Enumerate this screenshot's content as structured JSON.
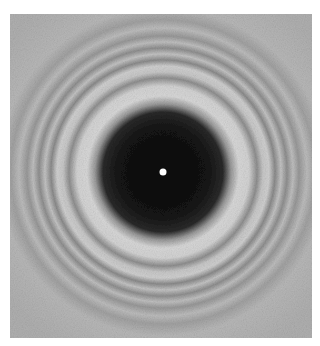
{
  "image": {
    "subject": "circular diffraction pattern with central bright spot",
    "colors": {
      "background_gray": "#b4b4b4",
      "dark_disc": "#0c0c0c",
      "bright_ring": "#dcdcdc",
      "dark_ring": "#8a8a8a",
      "center_spot": "#ffffff"
    }
  }
}
